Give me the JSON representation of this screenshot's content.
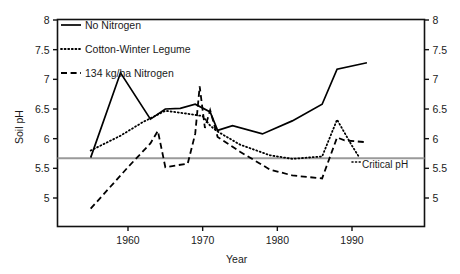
{
  "chart_data": {
    "type": "line",
    "title": "",
    "xlabel": "Year",
    "ylabel": "Soil pH",
    "xlim": [
      1952.5,
      1994.5
    ],
    "ylim": [
      4.65,
      8.0
    ],
    "grid": false,
    "legend_position": "top-left",
    "x_ticks": [
      "1960",
      "1970",
      "1980",
      "1990"
    ],
    "x_tick_values": [
      1960,
      1970,
      1980,
      1990
    ],
    "y_ticks_left": [
      "8",
      "7.5",
      "7",
      "6.5",
      "6",
      "5.5",
      "5"
    ],
    "y_ticks_right": [
      "8",
      "7.5",
      "7",
      "6.5",
      "6",
      "5.5",
      "5"
    ],
    "y_tick_values": [
      8,
      7.5,
      7,
      6.5,
      6,
      5.5,
      5
    ],
    "annotations": [
      {
        "label": "Critical pH",
        "y": 5.67,
        "style": "grey-horizontal-line"
      }
    ],
    "series": [
      {
        "name": "No Nitrogen",
        "style": "solid",
        "color": "#000000",
        "points": [
          [
            1955,
            5.68
          ],
          [
            1959,
            7.11
          ],
          [
            1963,
            6.33
          ],
          [
            1965,
            6.5
          ],
          [
            1967,
            6.51
          ],
          [
            1969,
            6.58
          ],
          [
            1971,
            6.45
          ],
          [
            1972,
            6.14
          ],
          [
            1974,
            6.22
          ],
          [
            1978,
            6.08
          ],
          [
            1982,
            6.3
          ],
          [
            1986,
            6.58
          ],
          [
            1988,
            7.17
          ],
          [
            1992,
            7.28
          ]
        ]
      },
      {
        "name": "Cotton-Winter Legume",
        "style": "dotted",
        "color": "#000000",
        "points": [
          [
            1955,
            5.8
          ],
          [
            1959,
            6.05
          ],
          [
            1962,
            6.28
          ],
          [
            1965,
            6.47
          ],
          [
            1968,
            6.42
          ],
          [
            1970,
            6.38
          ],
          [
            1971,
            6.22
          ],
          [
            1972,
            6.12
          ],
          [
            1975,
            5.9
          ],
          [
            1979,
            5.72
          ],
          [
            1982,
            5.66
          ],
          [
            1986,
            5.7
          ],
          [
            1988,
            6.32
          ],
          [
            1990,
            5.88
          ],
          [
            1991,
            5.68
          ]
        ]
      },
      {
        "name": "134 kg/ha Nitrogen",
        "style": "dashed",
        "color": "#000000",
        "points": [
          [
            1955,
            4.82
          ],
          [
            1960,
            5.52
          ],
          [
            1963,
            5.92
          ],
          [
            1964,
            6.13
          ],
          [
            1965,
            5.52
          ],
          [
            1968,
            5.58
          ],
          [
            1969,
            6.08
          ],
          [
            1969.6,
            6.88
          ],
          [
            1970.3,
            6.18
          ],
          [
            1971,
            6.48
          ],
          [
            1972,
            6.03
          ],
          [
            1975,
            5.78
          ],
          [
            1979,
            5.48
          ],
          [
            1982,
            5.38
          ],
          [
            1986,
            5.33
          ],
          [
            1988,
            6.02
          ],
          [
            1989,
            5.97
          ],
          [
            1992,
            5.94
          ]
        ]
      }
    ]
  },
  "legend": {
    "items": [
      {
        "label": "No Nitrogen",
        "style": "solid"
      },
      {
        "label": "Cotton-Winter Legume",
        "style": "dotted"
      },
      {
        "label": "134 kg/ha Nitrogen",
        "style": "dashed"
      }
    ]
  },
  "labels": {
    "y_axis_title": "Soil pH",
    "x_axis_title": "Year",
    "critical_ph": "Critical pH"
  }
}
